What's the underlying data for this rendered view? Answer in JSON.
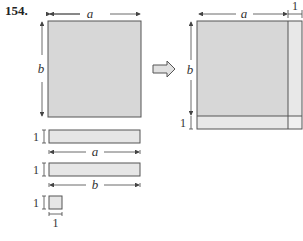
{
  "problem_number": "154.",
  "labels": {
    "a": "a",
    "b": "b",
    "one": "1"
  },
  "colors": {
    "big_fill": "#d7d7d7",
    "strip_fill": "#e6e6e6",
    "stroke": "#555555",
    "dim_line": "#444444"
  },
  "figures": {
    "left": [
      "square a×b",
      "strip 1×a",
      "strip 1×b",
      "square 1×1"
    ],
    "arrow": "implies-arrow",
    "right": "composite rectangle (a+1)×(b+1)"
  }
}
